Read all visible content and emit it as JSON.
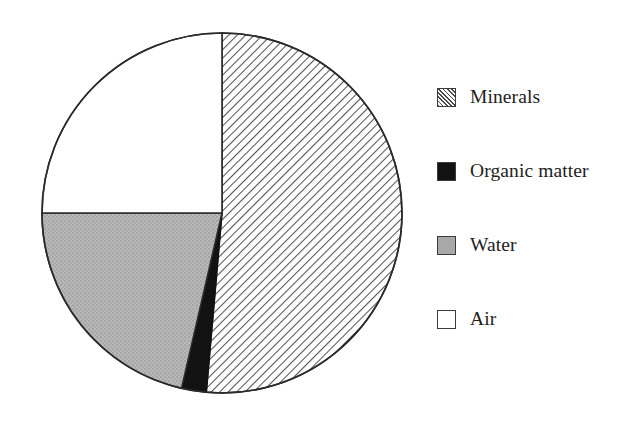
{
  "chart_data": {
    "type": "pie",
    "title": "",
    "subtitle": "",
    "xlabel": "",
    "ylabel": "",
    "grid": false,
    "legend_position": "right",
    "start_angle_deg": 0,
    "direction": "clockwise",
    "categories": [
      "Minerals",
      "Organic matter",
      "Water",
      "Air"
    ],
    "values": [
      45,
      5,
      25,
      25
    ],
    "units": "percent",
    "slices": [
      {
        "label": "Minerals",
        "value": 45,
        "start_angle_deg": 0,
        "end_angle_deg": 185,
        "fill": "diagonal-hatch",
        "color": "#ffffff",
        "hatch_color": "#4a4a4a"
      },
      {
        "label": "Organic matter",
        "value": 5,
        "start_angle_deg": 185,
        "end_angle_deg": 193,
        "fill": "solid",
        "color": "#121212",
        "hatch_color": ""
      },
      {
        "label": "Water",
        "value": 25,
        "start_angle_deg": 193,
        "end_angle_deg": 270,
        "fill": "stipple",
        "color": "#b0b0b0",
        "hatch_color": ""
      },
      {
        "label": "Air",
        "value": 25,
        "start_angle_deg": 270,
        "end_angle_deg": 360,
        "fill": "solid",
        "color": "#ffffff",
        "hatch_color": ""
      }
    ],
    "geometry": {
      "center_x": 222,
      "center_y": 213,
      "radius": 180,
      "outline_color": "#2b2b2b",
      "outline_width": 1.6
    }
  },
  "legend": {
    "items": [
      {
        "label": "Minerals",
        "swatch": "hatch-swatch"
      },
      {
        "label": "Organic matter",
        "swatch": "black-swatch"
      },
      {
        "label": "Water",
        "swatch": "gray-swatch"
      },
      {
        "label": "Air",
        "swatch": "white-swatch"
      }
    ]
  }
}
